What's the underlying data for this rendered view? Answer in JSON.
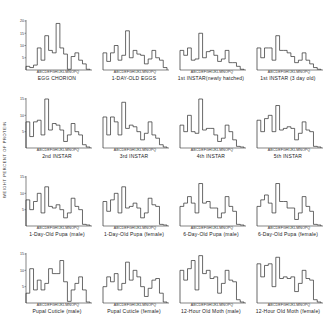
{
  "chart_data": {
    "type": "bar",
    "subtype": "step-histogram-grid",
    "ylabel": "WEIGHT PERCENT OF PROTEIN",
    "categories": [
      "A",
      "B",
      "C",
      "D",
      "E",
      "F",
      "G",
      "H",
      "I",
      "J",
      "K",
      "L",
      "M",
      "N",
      "O",
      "P",
      "Q"
    ],
    "category_label": "ABCDEFGHIJKLMNOPQ",
    "grid": false,
    "panels": [
      {
        "title": "EGG CHORION",
        "ylim": [
          0,
          20
        ],
        "yticks": [
          5,
          10,
          15,
          20
        ],
        "values": [
          1.5,
          1,
          2,
          9,
          4,
          14,
          8,
          7,
          19,
          9,
          6.5,
          0.3,
          5.5,
          7,
          4,
          2.5,
          0.3
        ]
      },
      {
        "title": "1-DAY-OLD EGGS",
        "ylim": [
          0,
          20
        ],
        "yticks": [],
        "values": [
          7,
          3.5,
          7,
          10,
          4,
          6,
          16,
          5,
          8,
          6.5,
          6,
          2.5,
          4.5,
          8,
          5,
          4,
          1
        ]
      },
      {
        "title": "1st INSTAR(newly hatched)",
        "ylim": [
          0,
          20
        ],
        "yticks": [],
        "values": [
          8,
          6,
          9,
          4,
          4.5,
          15,
          5,
          7.5,
          8,
          6,
          3.5,
          4.5,
          8,
          3,
          3,
          1.5,
          0.3
        ]
      },
      {
        "title": "1st INSTAR (3 day old)",
        "ylim": [
          0,
          20
        ],
        "yticks": [],
        "values": [
          9,
          5,
          9,
          9,
          4,
          14,
          8,
          8,
          7,
          5.5,
          3,
          4,
          7,
          4,
          2.5,
          1,
          0.3
        ]
      },
      {
        "title": "2nd INSTAR",
        "ylim": [
          0,
          15
        ],
        "yticks": [
          5,
          10,
          15
        ],
        "values": [
          8,
          3.5,
          8,
          8.5,
          4,
          15,
          5.5,
          7.5,
          7,
          5.5,
          2,
          4,
          7.5,
          5,
          4,
          1,
          0.3
        ]
      },
      {
        "title": "3rd INSTAR",
        "ylim": [
          0,
          15
        ],
        "yticks": [],
        "values": [
          9.5,
          4,
          9.5,
          8,
          4,
          14,
          6,
          7,
          6.5,
          5,
          2.5,
          4.5,
          8,
          4,
          3,
          1,
          0.3
        ]
      },
      {
        "title": "4th INSTAR",
        "ylim": [
          0,
          15
        ],
        "yticks": [],
        "values": [
          7,
          5,
          10,
          5,
          4.5,
          15,
          5.5,
          6,
          6,
          4,
          2,
          3,
          7,
          5,
          2.5,
          0.5,
          0.3
        ]
      },
      {
        "title": "5th INSTAR",
        "ylim": [
          0,
          15
        ],
        "yticks": [],
        "values": [
          8.5,
          5,
          9,
          10,
          5,
          13,
          5.5,
          6,
          6.5,
          6,
          2.5,
          4.5,
          8,
          5.5,
          5,
          0.5,
          0.3
        ]
      },
      {
        "title": "1-Day-Old Pupa (male)",
        "ylim": [
          0,
          15
        ],
        "yticks": [
          5,
          10,
          15
        ],
        "values": [
          8,
          5,
          7.5,
          10,
          4,
          12,
          6,
          5.5,
          6.5,
          5,
          2.5,
          4,
          8.5,
          6,
          5,
          0.5,
          0.3
        ]
      },
      {
        "title": "1-Day-Old Pupa (female)",
        "ylim": [
          0,
          15
        ],
        "yticks": [],
        "values": [
          7.5,
          4.5,
          8,
          10,
          4,
          12,
          5.5,
          6,
          7,
          5.5,
          2.5,
          4,
          8.5,
          6.5,
          6,
          0.5,
          0.3
        ]
      },
      {
        "title": "6-Day-Old Pupa (male)",
        "ylim": [
          0,
          15
        ],
        "yticks": [],
        "values": [
          6,
          7,
          9,
          7,
          4,
          13,
          7,
          7.5,
          5.5,
          5.5,
          2.5,
          4,
          9,
          6,
          4.5,
          0.5,
          0.3
        ]
      },
      {
        "title": "6-Day-Old Pupa (female)",
        "ylim": [
          0,
          15
        ],
        "yticks": [],
        "values": [
          6,
          8,
          9.5,
          7,
          4,
          13,
          7.5,
          7.5,
          5.5,
          5.5,
          2,
          4,
          9,
          6,
          4.5,
          0.5,
          0.3
        ]
      },
      {
        "title": "Pupal Cuticle (male)",
        "ylim": [
          0,
          15
        ],
        "yticks": [
          5,
          10,
          15
        ],
        "values": [
          3,
          10.5,
          4,
          7,
          4,
          6,
          10.5,
          9,
          9,
          13,
          6.5,
          0.5,
          4,
          6,
          8,
          4,
          0.3
        ]
      },
      {
        "title": "Pupal Cuticle (female)",
        "ylim": [
          0,
          15
        ],
        "yticks": [],
        "values": [
          5,
          8,
          6.5,
          9,
          4,
          6,
          12.5,
          7,
          10,
          8,
          5,
          2,
          4.5,
          7,
          7.5,
          3,
          0.3
        ]
      },
      {
        "title": "12-Hour Old Moth (male)",
        "ylim": [
          0,
          15
        ],
        "yticks": [],
        "values": [
          10,
          7,
          10.5,
          13,
          4,
          14.5,
          9,
          10,
          7.5,
          8,
          3,
          6,
          10,
          7,
          6.5,
          1,
          0.3
        ]
      },
      {
        "title": "12-Hour Old Moth (female)",
        "ylim": [
          0,
          15
        ],
        "yticks": [],
        "values": [
          12,
          8,
          11.5,
          12,
          5,
          14,
          7.5,
          8,
          7.5,
          8,
          3.5,
          6,
          10,
          7.5,
          7,
          1,
          0.3
        ]
      }
    ]
  }
}
